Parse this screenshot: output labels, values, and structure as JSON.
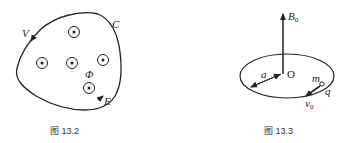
{
  "figures": [
    {
      "caption": "图 13.2",
      "labels": {
        "curve": "C",
        "top_left": "V",
        "flux": "Φ",
        "bottom_right": "E"
      },
      "field_points": 5,
      "description": "Closed curve C enclosing five out-of-page magnetic field markers (circled dots), with direction arrows"
    },
    {
      "caption": "图 13.3",
      "labels": {
        "field": "B",
        "field_sub": "0",
        "radius": "a",
        "center": "O",
        "mass": "m",
        "charge": "q",
        "velocity": "v",
        "velocity_sub": "0"
      },
      "description": "Circular ring of radius a centered at O in a vertical field B0; charge q of mass m moving with velocity v0"
    }
  ]
}
